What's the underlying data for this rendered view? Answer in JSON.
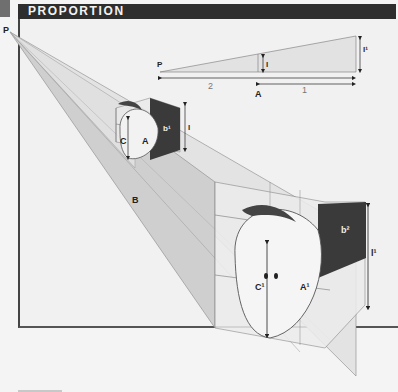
{
  "header": {
    "title": "PROPORTION"
  },
  "diagram": {
    "vanishing_point_label": "P",
    "inset": {
      "point_label": "P",
      "small_height_label": "l",
      "large_height_label": "l¹",
      "segment_long_label": "2",
      "segment_short_label": "1",
      "midpoint_label": "A"
    },
    "near_object": {
      "height_label": "l",
      "face_label": "b¹",
      "left_label": "C",
      "right_label": "A"
    },
    "ground_label": "B",
    "far_object": {
      "height_label": "l¹",
      "face_label": "b²",
      "left_label": "C¹",
      "right_label": "A¹"
    }
  },
  "colors": {
    "title_bar": "#2e2e2e",
    "dark_face": "#3a3a3a",
    "plane_shade": "#d2d2d2",
    "background": "#f1f1f1"
  }
}
